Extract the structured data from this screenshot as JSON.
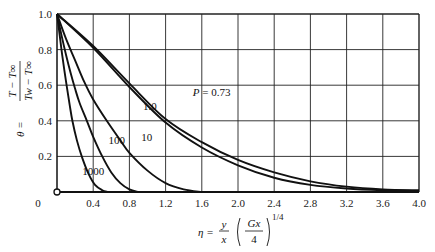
{
  "chart_data": {
    "type": "line",
    "title": "",
    "xlabel": "η = (y/x)(Gx/4)^(1/4)",
    "ylabel": "θ = (T − T∞)/(Tw − T∞)",
    "xlim": [
      0,
      4.0
    ],
    "ylim": [
      0,
      1.0
    ],
    "grid": true,
    "x_ticks": [
      "0",
      "0.4",
      "0.8",
      "1.2",
      "1.6",
      "2.0",
      "2.4",
      "2.8",
      "3.2",
      "3.6",
      "4.0"
    ],
    "y_ticks": [
      "0.2",
      "0.4",
      "0.6",
      "0.8",
      "1.0"
    ],
    "parameter_label": "P",
    "series": [
      {
        "name": "P = 0.73",
        "label": "P = 0.73",
        "x": [
          0,
          0.4,
          0.8,
          1.2,
          1.6,
          2.0,
          2.4,
          2.8,
          3.2,
          3.6,
          4.0
        ],
        "y": [
          1.0,
          0.82,
          0.61,
          0.41,
          0.28,
          0.18,
          0.11,
          0.06,
          0.03,
          0.015,
          0.01
        ]
      },
      {
        "name": "1.0",
        "label": "1.0",
        "x": [
          0,
          0.4,
          0.8,
          1.2,
          1.6,
          2.0,
          2.4,
          2.8,
          3.2,
          3.6,
          4.0
        ],
        "y": [
          1.0,
          0.81,
          0.59,
          0.39,
          0.25,
          0.15,
          0.08,
          0.04,
          0.02,
          0.01,
          0.005
        ]
      },
      {
        "name": "10",
        "label": "10",
        "x": [
          0,
          0.1,
          0.2,
          0.3,
          0.4,
          0.55,
          0.7,
          0.8,
          1.0,
          1.2,
          1.4,
          1.6
        ],
        "y": [
          1.0,
          0.86,
          0.74,
          0.62,
          0.52,
          0.4,
          0.29,
          0.22,
          0.12,
          0.05,
          0.015,
          0.0
        ]
      },
      {
        "name": "100",
        "label": "100",
        "x": [
          0,
          0.05,
          0.1,
          0.15,
          0.2,
          0.25,
          0.33,
          0.4,
          0.5,
          0.6,
          0.7,
          0.8,
          0.9
        ],
        "y": [
          1.0,
          0.88,
          0.77,
          0.67,
          0.58,
          0.5,
          0.4,
          0.31,
          0.2,
          0.11,
          0.05,
          0.015,
          0.0
        ]
      },
      {
        "name": "1000",
        "label": "1000",
        "x": [
          0,
          0.03,
          0.06,
          0.1,
          0.14,
          0.17,
          0.22,
          0.28,
          0.35,
          0.42,
          0.5,
          0.56
        ],
        "y": [
          1.0,
          0.88,
          0.76,
          0.62,
          0.49,
          0.4,
          0.29,
          0.19,
          0.1,
          0.04,
          0.01,
          0.0
        ]
      }
    ],
    "annotations": [
      {
        "text": "P = 0.73",
        "x": 1.5,
        "y": 0.54
      },
      {
        "text": "1.0",
        "x": 0.95,
        "y": 0.46
      },
      {
        "text": "10",
        "x": 0.93,
        "y": 0.285
      },
      {
        "text": "100",
        "x": 0.57,
        "y": 0.27
      },
      {
        "text": "1000",
        "x": 0.28,
        "y": 0.095
      }
    ]
  },
  "axes": {
    "origin_label": "0",
    "y_label_theta": "θ =",
    "y_label_num": "T − T∞",
    "y_label_den": "Tw − T∞",
    "x_label_eta": "η =",
    "x_label_y": "y",
    "x_label_x": "x",
    "x_label_G": "Gx",
    "x_label_4": "4",
    "x_label_exp": "1/4"
  }
}
